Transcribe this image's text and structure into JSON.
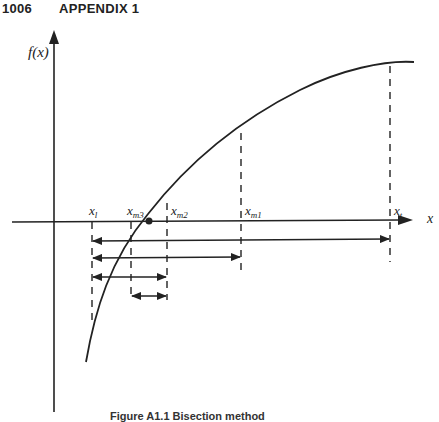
{
  "header": {
    "page_number": "1006",
    "section": "APPENDIX 1"
  },
  "figure": {
    "y_axis_label": "f(x)",
    "x_axis_label": "x",
    "point_labels": [
      {
        "id": "xl",
        "base": "x",
        "sub": "l"
      },
      {
        "id": "xm3",
        "base": "x",
        "sub": "m3"
      },
      {
        "id": "xm2",
        "base": "x",
        "sub": "m2"
      },
      {
        "id": "xm1",
        "base": "x",
        "sub": "m1"
      },
      {
        "id": "xt",
        "base": "x",
        "sub": "t"
      }
    ],
    "intervals": [
      {
        "from": "xl",
        "to": "xt"
      },
      {
        "from": "xl",
        "to": "xm1"
      },
      {
        "from": "xl",
        "to": "xm2"
      },
      {
        "from": "xm3",
        "to": "xm2"
      }
    ],
    "curve": "increasing concave function crossing x-axis between xm3 and xm2 (root marked with dot)"
  },
  "caption": "Figure A1.1 Bisection method"
}
